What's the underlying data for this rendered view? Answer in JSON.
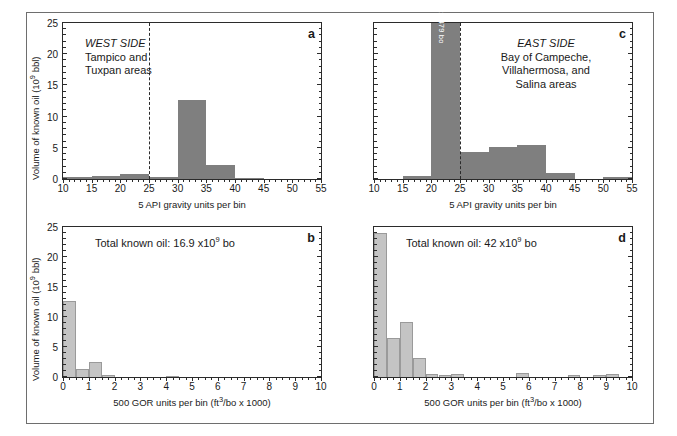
{
  "figure": {
    "axis_titles": {
      "y_volume": "Volume of known oil (10⁹ bbl)",
      "x_api": "5 API gravity units per bin",
      "x_gor": "500 GOR units per bin (ft³/bo x 1000)"
    },
    "colors": {
      "bar_dark": "#7f7f7f",
      "bar_light": "#c4c4c4",
      "axis": "#2b2b2b",
      "frame": "#6e6e6e",
      "background": "#ffffff"
    }
  },
  "panels": {
    "a": {
      "letter": "a",
      "region_title": "WEST SIDE",
      "region_lines": [
        "Tampico and",
        "Tuxpan areas"
      ],
      "chart_data": {
        "type": "bar",
        "title": "WEST SIDE — Tampico and Tuxpan areas",
        "xlabel": "5 API gravity units per bin",
        "ylabel": "Volume of known oil (10⁹ bbl)",
        "xlim": [
          10,
          55
        ],
        "ylim": [
          0,
          25
        ],
        "xticks": [
          10,
          15,
          20,
          25,
          30,
          35,
          40,
          45,
          50,
          55
        ],
        "yticks": [
          0,
          5,
          10,
          15,
          20,
          25
        ],
        "ytick_labels": [
          "0",
          "5",
          "10",
          "15",
          "20",
          "25"
        ],
        "bin_width": 5,
        "grid": false,
        "legend": null,
        "annotation_line_x": 25,
        "annotation_line_style": "dashed",
        "categories": [
          12.5,
          17.5,
          22.5,
          27.5,
          32.5,
          37.5,
          42.5
        ],
        "values": [
          0.25,
          0.55,
          0.85,
          0.4,
          12.6,
          2.2,
          0.2
        ]
      }
    },
    "b": {
      "letter": "b",
      "total_label": "Total known oil: 16.9 x10⁹ bo",
      "chart_data": {
        "type": "bar",
        "title": "Total known oil: 16.9 x10⁹ bo",
        "xlabel": "500 GOR units per bin (ft³/bo x 1000)",
        "ylabel": "Volume of known oil (10⁹ bbl)",
        "xlim": [
          0,
          10
        ],
        "ylim": [
          0,
          25
        ],
        "xticks": [
          0,
          1,
          2,
          3,
          4,
          5,
          6,
          7,
          8,
          9,
          10
        ],
        "yticks": [
          0,
          5,
          10,
          15,
          20,
          25
        ],
        "ytick_labels": [
          "0",
          "5",
          "10",
          "15",
          "20",
          "25"
        ],
        "bin_width": 0.5,
        "grid": false,
        "legend": null,
        "categories": [
          0.25,
          0.75,
          1.25,
          1.75,
          4.25
        ],
        "values": [
          12.7,
          1.4,
          2.5,
          0.35,
          0.25
        ]
      }
    },
    "c": {
      "letter": "c",
      "region_title": "EAST SIDE",
      "region_lines": [
        "Bay of Campeche,",
        "Villahermosa, and",
        "Salina areas"
      ],
      "tall_bar_label": "25.479 bo",
      "chart_data": {
        "type": "bar",
        "title": "EAST SIDE — Bay of Campeche, Villahermosa, and Salina areas",
        "xlabel": "5 API gravity units per bin",
        "ylabel": "Volume of known oil (10⁹ bbl)",
        "xlim": [
          10,
          55
        ],
        "ylim": [
          0,
          25
        ],
        "xticks": [
          10,
          15,
          20,
          25,
          30,
          35,
          40,
          45,
          50,
          55
        ],
        "yticks": [
          0,
          5,
          10,
          15,
          20,
          25
        ],
        "ytick_labels": [],
        "bin_width": 5,
        "grid": false,
        "legend": null,
        "annotation_line_x": 25,
        "annotation_line_style": "dashed",
        "categories": [
          17.5,
          22.5,
          27.5,
          32.5,
          37.5,
          42.5,
          52.5
        ],
        "values": [
          0.45,
          25.479,
          4.4,
          5.1,
          5.5,
          1.0,
          0.3
        ],
        "data_labels": [
          null,
          "25.479 bo",
          null,
          null,
          null,
          null,
          null
        ]
      }
    },
    "d": {
      "letter": "d",
      "total_label": "Total known oil: 42 x10⁹ bo",
      "chart_data": {
        "type": "bar",
        "title": "Total known oil: 42 x10⁹ bo",
        "xlabel": "500 GOR units per bin (ft³/bo x 1000)",
        "ylabel": "Volume of known oil (10⁹ bbl)",
        "xlim": [
          0,
          10
        ],
        "ylim": [
          0,
          25
        ],
        "xticks": [
          0,
          1,
          2,
          3,
          4,
          5,
          6,
          7,
          8,
          9,
          10
        ],
        "yticks": [
          0,
          5,
          10,
          15,
          20,
          25
        ],
        "ytick_labels": [],
        "bin_width": 0.5,
        "grid": false,
        "legend": null,
        "categories": [
          0.25,
          0.75,
          1.25,
          1.75,
          2.25,
          2.75,
          3.25,
          5.75,
          7.75,
          8.75,
          9.25
        ],
        "values": [
          24.0,
          6.5,
          9.2,
          3.1,
          0.5,
          0.35,
          0.45,
          0.7,
          0.3,
          0.3,
          0.45
        ]
      }
    }
  }
}
